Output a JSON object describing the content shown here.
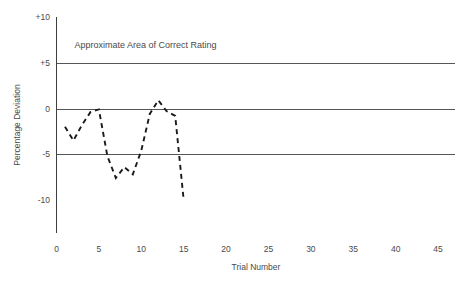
{
  "chart_data": {
    "type": "line",
    "title": "",
    "xlabel": "Trial Number",
    "ylabel": "Percentage Deviation",
    "xlim": [
      0,
      47
    ],
    "ylim": [
      -13,
      10
    ],
    "xticks": [
      "0",
      "5",
      "10",
      "15",
      "20",
      "25",
      "30",
      "35",
      "40",
      "45"
    ],
    "xtick_values": [
      0,
      5,
      10,
      15,
      20,
      25,
      30,
      35,
      40,
      45
    ],
    "yticks": [
      "+10",
      "+5",
      "0",
      "-5",
      "-10"
    ],
    "ytick_values": [
      10,
      5,
      0,
      -5,
      -10
    ],
    "gridlines_y": [
      5,
      0,
      -5
    ],
    "grid": true,
    "legend": "none",
    "linestyle": "dashed",
    "line_color": "#1a1a1a",
    "grid_color": "#555555",
    "annotations": [
      {
        "text": "Approximate Area of Correct Rating",
        "x": 10.5,
        "y": 6.6
      }
    ],
    "series": [
      {
        "name": "Percentage Deviation",
        "x": [
          1,
          2,
          3,
          4,
          5,
          6,
          7,
          8,
          9,
          10,
          11,
          12,
          13,
          14,
          15
        ],
        "values": [
          -2.0,
          -3.5,
          -1.8,
          -0.4,
          -0.1,
          -5.2,
          -7.6,
          -6.4,
          -7.2,
          -4.6,
          -0.6,
          0.9,
          -0.3,
          -0.8,
          -10.0
        ]
      }
    ]
  }
}
